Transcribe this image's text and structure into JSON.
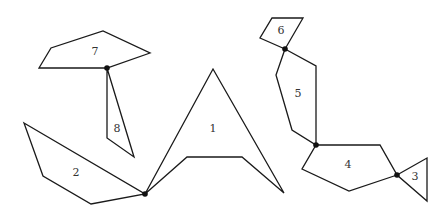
{
  "diagram": {
    "title": "",
    "stroke_color": "#1a1a1a",
    "joint_color": "#111111",
    "background": "#ffffff",
    "polygons": [
      {
        "id": "1",
        "label": "1",
        "points": "145,194 213,69 284,193 242,157 187,157",
        "label_pos": [
          213,
          129
        ]
      },
      {
        "id": "2",
        "label": "2",
        "points": "24,123 145,194 91,204 43,176",
        "label_pos": [
          76,
          173
        ]
      },
      {
        "id": "3",
        "label": "3",
        "points": "397,175 427,158 427,201",
        "label_pos": [
          415,
          177
        ]
      },
      {
        "id": "4",
        "label": "4",
        "points": "316,145 380,145 397,175 349,191 302,169",
        "label_pos": [
          348,
          165
        ]
      },
      {
        "id": "5",
        "label": "5",
        "points": "285,49 316,66 316,145 292,130 276,75",
        "label_pos": [
          298,
          94
        ]
      },
      {
        "id": "6",
        "label": "6",
        "points": "272,18 303,18 285,49 260,38",
        "label_pos": [
          281,
          31
        ]
      },
      {
        "id": "7",
        "label": "7",
        "points": "39,68 51,48 103,31 150,53 107,68",
        "label_pos": [
          95,
          52
        ]
      },
      {
        "id": "8",
        "label": "8",
        "points": "107,68 107,138 134,157",
        "label_pos": [
          117,
          129
        ]
      }
    ],
    "joints": [
      {
        "id": "joint-7-8",
        "x": 107,
        "y": 68
      },
      {
        "id": "joint-1-2",
        "x": 145,
        "y": 194
      },
      {
        "id": "joint-5-6",
        "x": 285,
        "y": 49
      },
      {
        "id": "joint-4-5",
        "x": 316,
        "y": 145
      },
      {
        "id": "joint-3-4",
        "x": 397,
        "y": 175
      }
    ]
  }
}
